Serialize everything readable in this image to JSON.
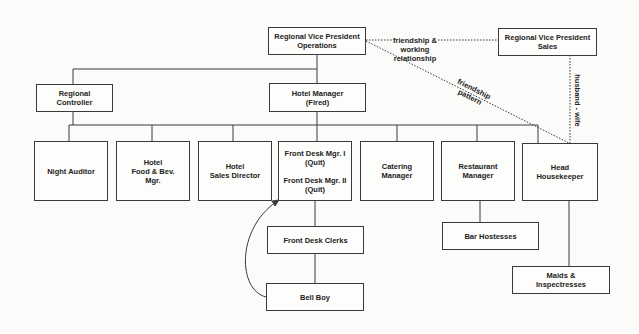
{
  "diagram": {
    "type": "organizational-chart",
    "nodes": {
      "rvp_ops": {
        "lines": [
          "Regional Vice President",
          "Operations"
        ]
      },
      "rvp_sales": {
        "lines": [
          "Regional Vice President",
          "Sales"
        ]
      },
      "reg_controller": {
        "lines": [
          "Regional",
          "Controller"
        ]
      },
      "hotel_manager": {
        "lines": [
          "Hotel Manager",
          "(Fired)"
        ]
      },
      "night_auditor": {
        "lines": [
          "Night Auditor"
        ]
      },
      "food_bev": {
        "lines": [
          "Hotel",
          "Food & Bev.",
          "Mgr."
        ]
      },
      "sales_director": {
        "lines": [
          "Hotel",
          "Sales Director"
        ]
      },
      "front_desk": {
        "lines": [
          "Front Desk Mgr. I",
          "(Quit)",
          "Front Desk Mgr. II",
          "(Quit)"
        ]
      },
      "catering": {
        "lines": [
          "Catering",
          "Manager"
        ]
      },
      "restaurant": {
        "lines": [
          "Restaurant",
          "Manager"
        ]
      },
      "head_housekeeper": {
        "lines": [
          "Head",
          "Housekeeper"
        ]
      },
      "front_desk_clerks": {
        "lines": [
          "Front Desk Clerks"
        ]
      },
      "bell_boy": {
        "lines": [
          "Bell Boy"
        ]
      },
      "bar_hostesses": {
        "lines": [
          "Bar Hostesses"
        ]
      },
      "maids": {
        "lines": [
          "Maids &",
          "Inspectresses"
        ]
      }
    },
    "relations": {
      "friendship_working": {
        "lines": [
          "friendship &",
          "working",
          "relationship"
        ]
      },
      "friendship_pattern": {
        "lines": [
          "friendship",
          "pattern"
        ]
      },
      "husband_wife": {
        "text": "husband - wife"
      }
    },
    "colors": {
      "line": "#3a3a3a",
      "background": "#fbfbf9",
      "text": "#222222"
    }
  }
}
